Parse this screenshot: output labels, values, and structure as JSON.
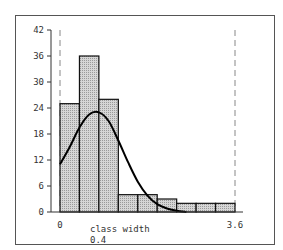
{
  "chart_data": {
    "type": "bar",
    "subtype": "histogram_with_density_curve",
    "title": "",
    "xlabel": "class width",
    "xlabel_sub": "0.4",
    "ylabel": "",
    "x_tick_labels": [
      "0",
      "3.6"
    ],
    "y_ticks": [
      0,
      6,
      12,
      18,
      24,
      30,
      36,
      42
    ],
    "ylim": [
      0,
      42
    ],
    "xlim": [
      0,
      3.6
    ],
    "bin_width": 0.4,
    "bin_edges": [
      0,
      0.4,
      0.8,
      1.2,
      1.6,
      2.0,
      2.4,
      2.8,
      3.2,
      3.6
    ],
    "values": [
      25,
      36,
      26,
      4,
      4,
      3,
      2,
      2,
      2
    ],
    "curve": {
      "name": "fitted density",
      "x": [
        0,
        0.2,
        0.4,
        0.6,
        0.8,
        1.0,
        1.2,
        1.4,
        1.6,
        1.8,
        2.0,
        2.2,
        2.4,
        2.6
      ],
      "y": [
        11,
        15,
        19.5,
        22.5,
        23,
        21,
        16.5,
        11.5,
        7,
        3.8,
        1.8,
        0.8,
        0.3,
        0
      ]
    },
    "reference_lines": [
      {
        "x": 0,
        "style": "dashed"
      },
      {
        "x": 3.6,
        "style": "dashed"
      }
    ],
    "grid": false,
    "legend": null
  },
  "colors": {
    "bar_fill": "#c8c8c8",
    "bar_stroke": "#111111",
    "curve": "#000000",
    "dashed_line": "#888888"
  }
}
